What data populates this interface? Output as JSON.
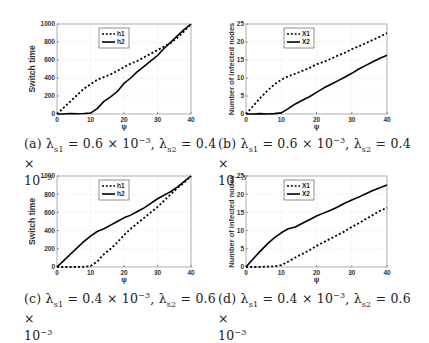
{
  "chart_data": [
    {
      "id": "a",
      "type": "line",
      "title": "",
      "xlabel": "ψ",
      "ylabel": "Switch time",
      "xlim": [
        0,
        40
      ],
      "ylim": [
        0,
        1000
      ],
      "xticks": [
        0,
        10,
        20,
        30,
        40
      ],
      "yticks": [
        0,
        200,
        400,
        600,
        800,
        1000
      ],
      "grid": true,
      "legend_position": "upper-left-inner",
      "x": [
        0,
        2,
        4,
        6,
        8,
        10,
        12,
        14,
        16,
        18,
        20,
        22,
        24,
        26,
        28,
        30,
        32,
        34,
        36,
        38,
        40
      ],
      "series": [
        {
          "name": "h1",
          "style": "dashed",
          "values": [
            0,
            70,
            140,
            210,
            280,
            330,
            380,
            410,
            440,
            480,
            520,
            560,
            590,
            630,
            670,
            710,
            750,
            790,
            850,
            920,
            1000
          ]
        },
        {
          "name": "h2",
          "style": "solid",
          "values": [
            0,
            0,
            5,
            3,
            5,
            10,
            60,
            140,
            190,
            250,
            340,
            400,
            470,
            530,
            590,
            650,
            730,
            800,
            870,
            940,
            1000
          ]
        }
      ],
      "caption": {
        "label": "(a)",
        "lambda_s1": "0.6",
        "lambda_s2": "0.4",
        "exp": "−3"
      }
    },
    {
      "id": "b",
      "type": "line",
      "title": "",
      "xlabel": "ψ",
      "ylabel": "Number of infected nodes",
      "xlim": [
        0,
        40
      ],
      "ylim": [
        0,
        25
      ],
      "xticks": [
        0,
        10,
        20,
        30,
        40
      ],
      "yticks": [
        0,
        5,
        10,
        15,
        20,
        25
      ],
      "grid": true,
      "legend_position": "upper-left-inner",
      "x": [
        0,
        2,
        4,
        6,
        8,
        10,
        12,
        14,
        16,
        18,
        20,
        22,
        24,
        26,
        28,
        30,
        32,
        34,
        36,
        38,
        40
      ],
      "series": [
        {
          "name": "X1",
          "style": "dashed",
          "values": [
            0,
            2.2,
            4.4,
            6.4,
            8.2,
            9.5,
            10.5,
            11.2,
            12.0,
            12.8,
            13.8,
            14.5,
            15.3,
            16.2,
            17.0,
            18.0,
            18.8,
            19.7,
            20.6,
            21.5,
            22.5
          ]
        },
        {
          "name": "X2",
          "style": "solid",
          "values": [
            0,
            0,
            0.1,
            0,
            0.1,
            0.3,
            1.5,
            2.8,
            3.8,
            4.8,
            6.0,
            7.2,
            8.2,
            9.2,
            10.2,
            11.3,
            12.5,
            13.5,
            14.5,
            15.5,
            16.3
          ]
        }
      ],
      "caption": {
        "label": "(b)",
        "lambda_s1": "0.6",
        "lambda_s2": "0.4",
        "exp": "−3"
      }
    },
    {
      "id": "c",
      "type": "line",
      "title": "",
      "xlabel": "ψ",
      "ylabel": "Switch time",
      "xlim": [
        0,
        40
      ],
      "ylim": [
        0,
        1000
      ],
      "xticks": [
        0,
        10,
        20,
        30,
        40
      ],
      "yticks": [
        0,
        200,
        400,
        600,
        800,
        1000
      ],
      "grid": true,
      "legend_position": "upper-left-inner",
      "x": [
        0,
        2,
        4,
        6,
        8,
        10,
        12,
        14,
        16,
        18,
        20,
        22,
        24,
        26,
        28,
        30,
        32,
        34,
        36,
        38,
        40
      ],
      "series": [
        {
          "name": "h1",
          "style": "dashed",
          "values": [
            0,
            0,
            0,
            0,
            3,
            10,
            60,
            140,
            200,
            270,
            350,
            420,
            480,
            540,
            600,
            660,
            730,
            800,
            870,
            930,
            1000
          ]
        },
        {
          "name": "h2",
          "style": "solid",
          "values": [
            0,
            70,
            140,
            210,
            280,
            340,
            390,
            420,
            460,
            500,
            540,
            570,
            610,
            650,
            700,
            750,
            790,
            830,
            880,
            940,
            1000
          ]
        }
      ],
      "caption": {
        "label": "(c)",
        "lambda_s1": "0.4",
        "lambda_s2": "0.6",
        "exp": "−3"
      }
    },
    {
      "id": "d",
      "type": "line",
      "title": "",
      "xlabel": "ψ",
      "ylabel": "Number of infected nodes",
      "xlim": [
        0,
        40
      ],
      "ylim": [
        0,
        25
      ],
      "xticks": [
        0,
        10,
        20,
        30,
        40
      ],
      "yticks": [
        0,
        5,
        10,
        15,
        20,
        25
      ],
      "grid": true,
      "legend_position": "upper-left-inner",
      "x": [
        0,
        2,
        4,
        6,
        8,
        10,
        12,
        14,
        16,
        18,
        20,
        22,
        24,
        26,
        28,
        30,
        32,
        34,
        36,
        38,
        40
      ],
      "series": [
        {
          "name": "X1",
          "style": "dashed",
          "values": [
            0,
            0,
            0,
            0.1,
            0.2,
            0.5,
            1.5,
            2.6,
            3.6,
            4.6,
            5.8,
            6.8,
            7.8,
            8.8,
            9.8,
            11.0,
            12.0,
            13.2,
            14.3,
            15.4,
            16.3
          ]
        },
        {
          "name": "X2",
          "style": "solid",
          "values": [
            0,
            2.2,
            4.3,
            6.3,
            8.0,
            9.4,
            10.5,
            11.0,
            12.0,
            13.0,
            14.0,
            14.8,
            15.6,
            16.5,
            17.5,
            18.4,
            19.2,
            20.1,
            21.0,
            21.8,
            22.5
          ]
        }
      ],
      "caption": {
        "label": "(d)",
        "lambda_s1": "0.4",
        "lambda_s2": "0.6",
        "exp": "−3"
      }
    }
  ],
  "captions": [
    {
      "line1_prefix": "(a) λ",
      "sub1": "s1",
      "eq1": " = 0.6 × 10",
      "exp1": "−3",
      "mid": ", λ",
      "sub2": "s2",
      "eq2": " = 0.4 ×",
      "line2": "10",
      "exp2": "−3"
    },
    {
      "line1_prefix": "(b) λ",
      "sub1": "s1",
      "eq1": " = 0.6 × 10",
      "exp1": "−3",
      "mid": ", λ",
      "sub2": "s2",
      "eq2": " = 0.4 ×",
      "line2": "10",
      "exp2": "−3"
    },
    {
      "line1_prefix": "(c) λ",
      "sub1": "s1",
      "eq1": " = 0.4 × 10",
      "exp1": "−3",
      "mid": ", λ",
      "sub2": "s2",
      "eq2": " = 0.6 ×",
      "line2": "10",
      "exp2": "−3"
    },
    {
      "line1_prefix": "(d) λ",
      "sub1": "s1",
      "eq1": " = 0.4 × 10",
      "exp1": "−3",
      "mid": ", λ",
      "sub2": "s2",
      "eq2": " = 0.6 ×",
      "line2": "10",
      "exp2": "−3"
    }
  ]
}
